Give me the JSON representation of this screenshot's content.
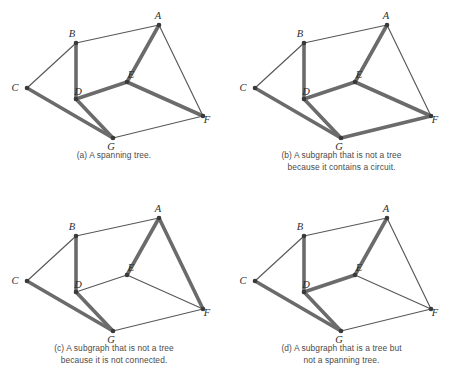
{
  "figure": {
    "vertex_labels": [
      "A",
      "B",
      "C",
      "D",
      "E",
      "F",
      "G"
    ],
    "vertex_positions": {
      "A": {
        "x": 159,
        "y": 25
      },
      "B": {
        "x": 76,
        "y": 43
      },
      "C": {
        "x": 27,
        "y": 88
      },
      "D": {
        "x": 76,
        "y": 99
      },
      "E": {
        "x": 127,
        "y": 82
      },
      "F": {
        "x": 203,
        "y": 116
      },
      "G": {
        "x": 113,
        "y": 138
      }
    },
    "label_offsets": {
      "A": {
        "dx": -1,
        "dy": -6
      },
      "B": {
        "dx": -4,
        "dy": -6
      },
      "C": {
        "dx": -12,
        "dy": 3
      },
      "D": {
        "dx": 2,
        "dy": -4
      },
      "E": {
        "dx": 4,
        "dy": -4
      },
      "F": {
        "dx": 4,
        "dy": 7
      },
      "G": {
        "dx": -2,
        "dy": 12
      }
    },
    "all_edges": [
      [
        "A",
        "B"
      ],
      [
        "A",
        "E"
      ],
      [
        "A",
        "F"
      ],
      [
        "B",
        "C"
      ],
      [
        "B",
        "D"
      ],
      [
        "C",
        "G"
      ],
      [
        "D",
        "E"
      ],
      [
        "D",
        "G"
      ],
      [
        "E",
        "F"
      ],
      [
        "G",
        "F"
      ]
    ],
    "colors": {
      "edge_thin": "#585858",
      "edge_bold": "#6b6b6b",
      "vertex": "#3a3a3a",
      "caption_text": "#4a4a4a",
      "background": "#ffffff"
    }
  },
  "panels": [
    {
      "id": "a",
      "caption_lines": [
        "(a) A spanning tree."
      ],
      "bold_edges": [
        [
          "B",
          "D"
        ],
        [
          "A",
          "E"
        ],
        [
          "D",
          "E"
        ],
        [
          "E",
          "F"
        ],
        [
          "C",
          "G"
        ],
        [
          "D",
          "G"
        ]
      ]
    },
    {
      "id": "b",
      "caption_lines": [
        "(b) A subgraph that is not a tree",
        "because it contains a circuit."
      ],
      "bold_edges": [
        [
          "B",
          "D"
        ],
        [
          "A",
          "E"
        ],
        [
          "D",
          "E"
        ],
        [
          "E",
          "F"
        ],
        [
          "C",
          "G"
        ],
        [
          "D",
          "G"
        ],
        [
          "G",
          "F"
        ]
      ]
    },
    {
      "id": "c",
      "caption_lines": [
        "(c) A subgraph that is not a tree",
        "because it is not connected."
      ],
      "bold_edges": [
        [
          "B",
          "D"
        ],
        [
          "A",
          "E"
        ],
        [
          "A",
          "F"
        ],
        [
          "C",
          "G"
        ],
        [
          "D",
          "G"
        ]
      ]
    },
    {
      "id": "d",
      "caption_lines": [
        "(d) A subgraph that is a tree but",
        "not a spanning tree."
      ],
      "bold_edges": [
        [
          "B",
          "D"
        ],
        [
          "A",
          "E"
        ],
        [
          "D",
          "E"
        ],
        [
          "C",
          "G"
        ],
        [
          "D",
          "G"
        ]
      ]
    }
  ]
}
